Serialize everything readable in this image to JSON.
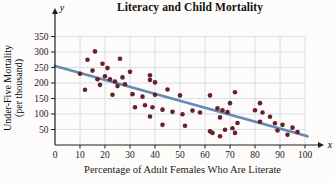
{
  "title": "Literacy and Child Mortality",
  "chart_data": {
    "type": "scatter",
    "title": "Literacy and Child Mortality",
    "xlabel": "Percentage of Adult Females Who Are Literate",
    "ylabel": "Under-Five Mortality (per thousand)",
    "ylabel_line1": "Under-Five Mortality",
    "ylabel_line2": "(per thousand)",
    "x_axis_var": "x",
    "y_axis_var": "y",
    "xlim": [
      0,
      100
    ],
    "ylim": [
      0,
      350
    ],
    "x_ticks": [
      0,
      10,
      20,
      30,
      40,
      50,
      60,
      70,
      80,
      90,
      100
    ],
    "y_ticks": [
      50,
      100,
      150,
      200,
      250,
      300,
      350
    ],
    "grid": true,
    "legend": false,
    "points": [
      [
        10,
        230
      ],
      [
        12,
        178
      ],
      [
        13,
        275
      ],
      [
        15,
        240
      ],
      [
        16,
        302
      ],
      [
        17,
        212
      ],
      [
        18,
        194
      ],
      [
        19,
        262
      ],
      [
        20,
        222
      ],
      [
        21,
        248
      ],
      [
        22,
        212
      ],
      [
        23,
        162
      ],
      [
        24,
        205
      ],
      [
        25,
        190
      ],
      [
        26,
        278
      ],
      [
        27,
        218
      ],
      [
        28,
        196
      ],
      [
        30,
        236
      ],
      [
        31,
        164
      ],
      [
        32,
        122
      ],
      [
        35,
        156
      ],
      [
        36,
        128
      ],
      [
        38,
        225
      ],
      [
        38,
        210
      ],
      [
        38,
        92
      ],
      [
        39,
        122
      ],
      [
        40,
        202
      ],
      [
        40,
        162
      ],
      [
        43,
        114
      ],
      [
        43,
        65
      ],
      [
        45,
        179
      ],
      [
        47,
        107
      ],
      [
        50,
        160
      ],
      [
        51,
        99
      ],
      [
        52,
        62
      ],
      [
        55,
        111
      ],
      [
        58,
        105
      ],
      [
        62,
        160
      ],
      [
        62,
        44
      ],
      [
        63,
        39
      ],
      [
        65,
        118
      ],
      [
        66,
        89
      ],
      [
        66,
        28
      ],
      [
        67,
        112
      ],
      [
        68,
        49
      ],
      [
        69,
        106
      ],
      [
        70,
        135
      ],
      [
        71,
        54
      ],
      [
        72,
        170
      ],
      [
        72,
        39
      ],
      [
        73,
        71
      ],
      [
        80,
        112
      ],
      [
        82,
        135
      ],
      [
        82,
        75
      ],
      [
        83,
        105
      ],
      [
        86,
        91
      ],
      [
        88,
        70
      ],
      [
        89,
        47
      ],
      [
        91,
        65
      ],
      [
        93,
        33
      ],
      [
        95,
        56
      ],
      [
        97,
        42
      ]
    ],
    "trend_line": {
      "x1": 0,
      "y1": 255,
      "x2": 101,
      "y2": 28
    },
    "colors": {
      "point": "#67202f",
      "trend": "#5f82ad",
      "grid": "#ccd8e5",
      "axis": "#1f1f1f",
      "text": "#1a1a1a"
    }
  }
}
